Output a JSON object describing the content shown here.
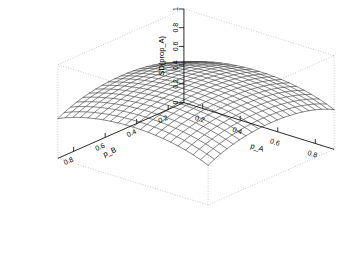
{
  "chart_data": {
    "type": "surface",
    "title": "",
    "subtitle": "",
    "zlabel": "SD(prop_A)",
    "xlabel": "p_A",
    "ylabel": "p_B",
    "grid": false,
    "legend": "none",
    "renderer": "wireframe-persp",
    "projection": {
      "theta": 40,
      "phi": 22,
      "expand": 0.85,
      "box": true,
      "box_style": "dotted-gray"
    },
    "zlim": [
      0,
      1
    ],
    "z_ticks": [
      "0",
      "0.2",
      "0.4",
      "0.6",
      "0.8",
      "1"
    ],
    "z_tick_values": [
      0,
      0.2,
      0.4,
      0.6,
      0.8,
      1
    ],
    "xlim": [
      0.1,
      0.9
    ],
    "x_ticks": [
      "0.2",
      "0.4",
      "0.6",
      "0.8"
    ],
    "x_tick_values": [
      0.2,
      0.4,
      0.6,
      0.8
    ],
    "ylim": [
      0.1,
      0.9
    ],
    "y_ticks": [
      "0.8",
      "0.6",
      "0.4",
      "0.2"
    ],
    "y_tick_values": [
      0.8,
      0.6,
      0.4,
      0.2
    ],
    "mesh_n_x": 21,
    "mesh_n_y": 21,
    "line_color": "#3c3c3c",
    "box_color": "#b4b4b4",
    "surface_formula": "z = sqrt(pA*(1-pA) + pB*(1-pB))",
    "x_grid": [
      0.1,
      0.14,
      0.18,
      0.22,
      0.26,
      0.3,
      0.34,
      0.38,
      0.42,
      0.46,
      0.5,
      0.54,
      0.58,
      0.62,
      0.66,
      0.7,
      0.74,
      0.78,
      0.82,
      0.86,
      0.9
    ],
    "y_grid": [
      0.1,
      0.14,
      0.18,
      0.22,
      0.26,
      0.3,
      0.34,
      0.38,
      0.42,
      0.46,
      0.5,
      0.54,
      0.58,
      0.62,
      0.66,
      0.7,
      0.74,
      0.78,
      0.82,
      0.86,
      0.9
    ],
    "z_corner_values": {
      "back_x_min_y_min": 0.424,
      "front_x_max_y_min": 0.424,
      "front_x_max_y_max": 0.424,
      "peak_center": 0.707
    }
  },
  "axes": {
    "z": {
      "title": "SD(prop_A)"
    },
    "x": {
      "title": "p_A"
    },
    "y": {
      "title": "p_B"
    }
  }
}
